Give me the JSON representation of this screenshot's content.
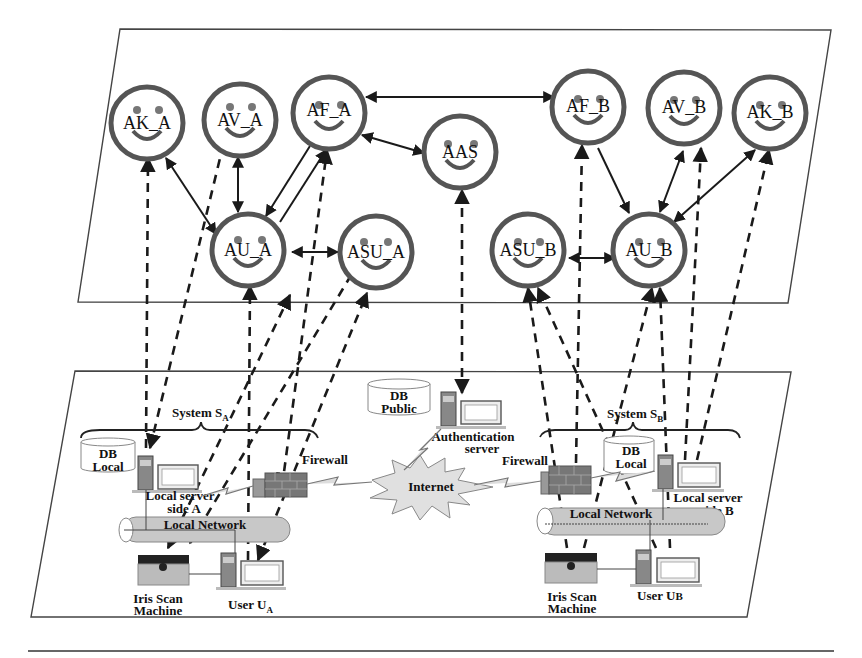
{
  "diagram": {
    "type": "multi-agent authentication architecture",
    "agent_layer": {
      "agents": [
        {
          "id": "AK_A",
          "label": "AK_A",
          "cx": 147,
          "cy": 123,
          "r": 36
        },
        {
          "id": "AV_A",
          "label": "AV_A",
          "cx": 240,
          "cy": 120,
          "r": 36
        },
        {
          "id": "AF_A",
          "label": "AF_A",
          "cx": 329,
          "cy": 113,
          "r": 36
        },
        {
          "id": "AAS",
          "label": "AAS",
          "cx": 460,
          "cy": 152,
          "r": 36
        },
        {
          "id": "AU_A",
          "label": "AU_A",
          "cx": 248,
          "cy": 250,
          "r": 36
        },
        {
          "id": "ASU_A",
          "label": "ASU_A",
          "cx": 376,
          "cy": 252,
          "r": 36
        },
        {
          "id": "AF_B",
          "label": "AF_B",
          "cx": 588,
          "cy": 107,
          "r": 36
        },
        {
          "id": "AV_B",
          "label": "AV_B",
          "cx": 684,
          "cy": 108,
          "r": 36
        },
        {
          "id": "AK_B",
          "label": "AK_B",
          "cx": 770,
          "cy": 113,
          "r": 36
        },
        {
          "id": "ASU_B",
          "label": "ASU_B",
          "cx": 528,
          "cy": 250,
          "r": 36
        },
        {
          "id": "AU_B",
          "label": "AU_B",
          "cx": 649,
          "cy": 250,
          "r": 36
        }
      ],
      "connections": [
        {
          "from": "AK_A",
          "to": "AU_A",
          "style": "bidirectional"
        },
        {
          "from": "AV_A",
          "to": "AU_A",
          "style": "bidirectional"
        },
        {
          "from": "AF_A",
          "to": "AU_A",
          "style": "double-line"
        },
        {
          "from": "AU_A",
          "to": "ASU_A",
          "style": "bidirectional"
        },
        {
          "from": "AF_A",
          "to": "AF_B",
          "style": "bidirectional"
        },
        {
          "from": "AF_A",
          "to": "AAS",
          "style": "bidirectional"
        },
        {
          "from": "AF_B",
          "to": "AU_B",
          "style": "directed"
        },
        {
          "from": "AV_B",
          "to": "AU_B",
          "style": "bidirectional"
        },
        {
          "from": "AK_B",
          "to": "AU_B",
          "style": "bidirectional"
        },
        {
          "from": "ASU_B",
          "to": "AU_B",
          "style": "bidirectional"
        }
      ]
    },
    "physical_layer": {
      "system_a": {
        "title": "System S",
        "subscript": "A",
        "db_label_1": "DB",
        "db_label_2": "Local",
        "server_label_1": "Local server",
        "server_label_2": "side A",
        "network_label": "Local Network",
        "firewall_label": "Firewall",
        "iris_label_1": "Iris Scan",
        "iris_label_2": "Machine",
        "user_label": "User U",
        "user_subscript": "A"
      },
      "center": {
        "db_label_1": "DB",
        "db_label_2": "Public",
        "auth_label_1": "Authentication",
        "auth_label_2": "server",
        "internet_label": "Internet"
      },
      "system_b": {
        "title": "System S",
        "subscript": "B",
        "db_label_1": "DB",
        "db_label_2": "Local",
        "server_label_1": "Local server",
        "server_label_2": "side B",
        "network_label": "Local Network",
        "firewall_label": "Firewall",
        "iris_label_1": "Iris Scan",
        "iris_label_2": "Machine",
        "user_label": "User U",
        "user_subscript": "B"
      }
    },
    "colors": {
      "agent_ring": "#555555",
      "line": "#1a1a1a",
      "network_pipe": "#c8c8c8",
      "internet_burst": "#dddddd"
    }
  }
}
